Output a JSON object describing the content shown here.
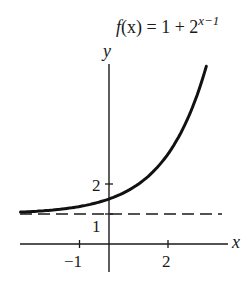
{
  "chart_data": {
    "type": "line",
    "title_parts": {
      "lhs": "f",
      "arg": "(x)",
      "eq": " = 1 + 2",
      "exponent": "x−1"
    },
    "xlabel": "x",
    "ylabel": "y",
    "function": "1 + 2^(x-1)",
    "xlim": [
      -3.0,
      4.3
    ],
    "ylim": [
      -1.2,
      6.5
    ],
    "x_ticks": [
      {
        "value": -1,
        "label": "−1"
      },
      {
        "value": 2,
        "label": "2"
      }
    ],
    "y_ticks": [
      {
        "value": 1,
        "label": "1"
      },
      {
        "value": 2,
        "label": "2"
      }
    ],
    "asymptote": {
      "y": 1,
      "style": "dashed"
    },
    "series": [
      {
        "name": "f(x) = 1 + 2^(x-1)",
        "x": [
          -3,
          -2.5,
          -2,
          -1.5,
          -1,
          -0.5,
          0,
          0.5,
          1,
          1.5,
          2,
          2.5,
          3,
          3.3
        ],
        "values": [
          1.063,
          1.088,
          1.125,
          1.177,
          1.25,
          1.354,
          1.5,
          1.707,
          2.0,
          2.414,
          3.0,
          3.828,
          5.0,
          5.925
        ]
      }
    ],
    "grid": false,
    "legend": "none"
  }
}
